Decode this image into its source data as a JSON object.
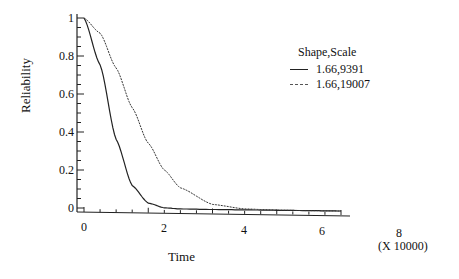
{
  "chart_data": {
    "type": "line",
    "title": "",
    "xlabel": "Time",
    "xlabel_multiplier": "(X 10000)",
    "ylabel": "Reliability",
    "xlim": [
      0,
      8
    ],
    "ylim": [
      0,
      1
    ],
    "x_ticks": [
      "0",
      "2",
      "4",
      "6",
      "8"
    ],
    "y_ticks": [
      "0",
      "0.2",
      "0.4",
      "0.6",
      "0.8",
      "1"
    ],
    "grid": false,
    "legend_title": "Shape,Scale",
    "legend_position": "upper right",
    "x": [
      0,
      0.5,
      1,
      1.5,
      2,
      2.5,
      3,
      4,
      5,
      6,
      7,
      8
    ],
    "series": [
      {
        "name": "1.66,9391",
        "style": "solid",
        "values": [
          1,
          0.754,
          0.364,
          0.121,
          0.03,
          0.006,
          0.001,
          0,
          0,
          0,
          0,
          0
        ]
      },
      {
        "name": "1.66,19007",
        "style": "dashed",
        "values": [
          1,
          0.921,
          0.739,
          0.531,
          0.345,
          0.205,
          0.112,
          0.027,
          0.005,
          0.001,
          0,
          0
        ]
      }
    ]
  }
}
